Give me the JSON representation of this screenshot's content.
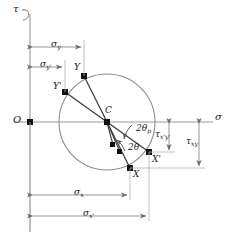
{
  "figure": {
    "kind": "mohrs-circle-diagram",
    "width": 229,
    "height": 239,
    "background": "#ffffff",
    "line_color": "#4a4a4a",
    "axis_color": "#8a8a8a",
    "dim_color": "#8a8a8a",
    "text_color": "#1a1a1a",
    "circle": {
      "cx": 107,
      "cy": 122,
      "r": 48
    }
  },
  "axes": {
    "tau_label": "τ",
    "sigma_label": "σ",
    "origin_label": "O",
    "vertical_axis_x": 30,
    "horizontal_axis_y": 122
  },
  "points": [
    {
      "id": "O",
      "label": "O",
      "prime": "",
      "x": 30,
      "y": 122
    },
    {
      "id": "C",
      "label": "C",
      "prime": "",
      "x": 107,
      "y": 122
    },
    {
      "id": "Y",
      "label": "Y",
      "prime": "",
      "x": 84,
      "y": 76
    },
    {
      "id": "Yprime",
      "label": "Y",
      "prime": "'",
      "x": 65,
      "y": 92
    },
    {
      "id": "X",
      "label": "X",
      "prime": "",
      "x": 130,
      "y": 168
    },
    {
      "id": "Xprime",
      "label": "X",
      "prime": "'",
      "x": 149,
      "y": 152
    },
    {
      "id": "P1",
      "label": "",
      "prime": "",
      "x": 113,
      "y": 145
    },
    {
      "id": "P2",
      "label": "",
      "prime": "",
      "x": 120,
      "y": 152
    }
  ],
  "angles": [
    {
      "id": "two-theta-p",
      "label": "2θ",
      "sub": "p",
      "x": 136,
      "y": 130
    },
    {
      "id": "two-theta",
      "label": "2θ",
      "sub": "",
      "x": 131,
      "y": 148
    }
  ],
  "dimensions": [
    {
      "id": "sigma-y",
      "label": "σ",
      "sub": "y",
      "prime": "",
      "x": 55,
      "y": 44,
      "from": 30,
      "to": 84,
      "line_y": 47
    },
    {
      "id": "sigma-y-prime",
      "label": "σ",
      "sub": "y",
      "prime": "'",
      "x": 45,
      "y": 63,
      "from": 30,
      "to": 65,
      "line_y": 67
    },
    {
      "id": "sigma-x",
      "label": "σ",
      "sub": "x",
      "prime": "",
      "x": 78,
      "y": 191,
      "from": 30,
      "to": 130,
      "line_y": 195
    },
    {
      "id": "sigma-x-prime",
      "label": "σ",
      "sub": "x",
      "prime": "'",
      "x": 88,
      "y": 212,
      "from": 30,
      "to": 149,
      "line_y": 216
    }
  ],
  "shear_dimensions": [
    {
      "id": "tau-xprime-yprime",
      "label": "τ",
      "sub": "x'y'",
      "x": 163,
      "y": 134,
      "line_x": 169,
      "from_y": 122,
      "to_y": 152
    },
    {
      "id": "tau-xy",
      "label": "τ",
      "sub": "xy",
      "x": 192,
      "y": 141,
      "line_x": 199,
      "from_y": 122,
      "to_y": 168
    }
  ]
}
